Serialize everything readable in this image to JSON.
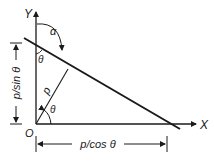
{
  "diagram": {
    "axes": {
      "x_label": "X",
      "y_label": "Y",
      "origin_label": "O"
    },
    "angles": {
      "alpha": "α",
      "theta_top": "θ",
      "theta_origin": "θ"
    },
    "perpendicular_label": "p",
    "dimensions": {
      "vertical": "p/sin θ",
      "horizontal": "p/cos θ"
    },
    "colors": {
      "stroke": "#1a1a1a",
      "background": "#ffffff"
    }
  }
}
